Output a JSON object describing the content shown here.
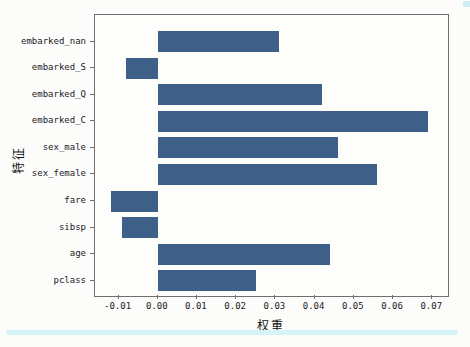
{
  "figure": {
    "bar_color": "#3e5f88",
    "spine_color": "#6f6f6f",
    "scan_accent_color": "#d6f4f6"
  },
  "chart_data": {
    "type": "bar",
    "orientation": "horizontal",
    "title": "",
    "xlabel": "权重",
    "ylabel": "特征",
    "categories": [
      "embarked_nan",
      "embarked_S",
      "embarked_Q",
      "embarked_C",
      "sex_male",
      "sex_female",
      "fare",
      "sibsp",
      "age",
      "pclass"
    ],
    "values": [
      0.031,
      -0.008,
      0.042,
      0.069,
      0.046,
      0.056,
      -0.012,
      -0.009,
      0.044,
      0.025
    ],
    "xlim": [
      -0.016,
      0.0735
    ],
    "xticks": [
      -0.01,
      0.0,
      0.01,
      0.02,
      0.03,
      0.04,
      0.05,
      0.06,
      0.07
    ],
    "xtick_labels": [
      "-0.01",
      "0.00",
      "0.01",
      "0.02",
      "0.03",
      "0.04",
      "0.05",
      "0.06",
      "0.07"
    ],
    "grid": false,
    "legend": null,
    "bar_color": "#3e5f88"
  }
}
